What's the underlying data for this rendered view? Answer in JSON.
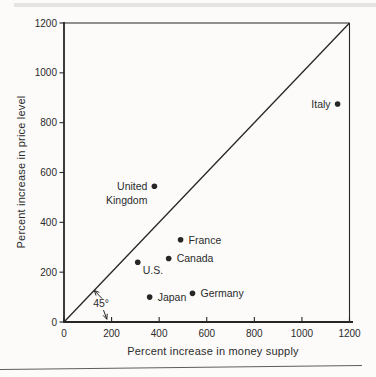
{
  "page": {
    "background": "#fcfbfa",
    "top_band_color": "#e4e4e2",
    "bottom_rule_color": "#5d5d5d"
  },
  "chart_data": {
    "type": "scatter",
    "xlabel": "Percent increase in money supply",
    "ylabel": "Percent increase in price level",
    "xlim": [
      0,
      1200
    ],
    "ylim": [
      0,
      1200
    ],
    "xticks": [
      0,
      200,
      400,
      600,
      800,
      1000,
      1200
    ],
    "yticks": [
      0,
      200,
      400,
      600,
      800,
      1000,
      1200
    ],
    "grid": false,
    "ink_color": "#262626",
    "reference_line": {
      "name": "45-degree line",
      "from": [
        0,
        0
      ],
      "to": [
        1200,
        1200
      ]
    },
    "angle_annotation": {
      "label": "45°",
      "label_xy": [
        156,
        76
      ],
      "arrows": [
        {
          "from": [
            160,
            94
          ],
          "to": [
            127,
            127
          ]
        },
        {
          "from": [
            166,
            48
          ],
          "to": [
            180,
            11
          ]
        }
      ]
    },
    "points": [
      {
        "id": "italy",
        "label": "Italy",
        "x": 1150,
        "y": 875,
        "label_lines": [
          "Italy"
        ],
        "anchor": "end",
        "dx": -7,
        "dy": 4
      },
      {
        "id": "united-kingdom",
        "label": "United Kingdom",
        "x": 380,
        "y": 545,
        "label_lines": [
          "United",
          "Kingdom"
        ],
        "anchor": "end",
        "dx": -7,
        "dy": 4
      },
      {
        "id": "france",
        "label": "France",
        "x": 490,
        "y": 330,
        "label_lines": [
          "France"
        ],
        "anchor": "start",
        "dx": 8,
        "dy": 4
      },
      {
        "id": "canada",
        "label": "Canada",
        "x": 440,
        "y": 255,
        "label_lines": [
          "Canada"
        ],
        "anchor": "start",
        "dx": 8,
        "dy": 4
      },
      {
        "id": "us",
        "label": "U.S.",
        "x": 310,
        "y": 240,
        "label_lines": [
          "U.S."
        ],
        "anchor": "start",
        "dx": 5,
        "dy": 12
      },
      {
        "id": "japan",
        "label": "Japan",
        "x": 360,
        "y": 100,
        "label_lines": [
          "Japan"
        ],
        "anchor": "start",
        "dx": 8,
        "dy": 4
      },
      {
        "id": "germany",
        "label": "Germany",
        "x": 540,
        "y": 115,
        "label_lines": [
          "Germany"
        ],
        "anchor": "start",
        "dx": 8,
        "dy": 4
      }
    ]
  }
}
